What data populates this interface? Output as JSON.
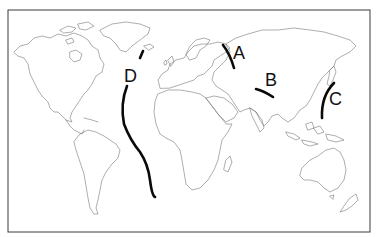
{
  "map": {
    "type": "world-outline",
    "projection": "equirectangular-like",
    "frame": {
      "x": 8,
      "y": 10,
      "width": 362,
      "height": 222,
      "border_color": "#3a3a3a"
    },
    "coast_color": "#6a6a6a",
    "line_color": "#0a0a0a",
    "labels": [
      {
        "id": "A",
        "text": "A",
        "x": 233,
        "y": 59
      },
      {
        "id": "B",
        "text": "B",
        "x": 265,
        "y": 86
      },
      {
        "id": "C",
        "text": "C",
        "x": 329,
        "y": 105
      },
      {
        "id": "D",
        "text": "D",
        "x": 124,
        "y": 82
      }
    ],
    "lines": [
      {
        "id": "A",
        "description": "Ural Mountains"
      },
      {
        "id": "B",
        "description": "Himalayas"
      },
      {
        "id": "C",
        "description": "Japan / western Pacific trench arc"
      },
      {
        "id": "D",
        "description": "Mid-Atlantic Ridge"
      }
    ]
  }
}
